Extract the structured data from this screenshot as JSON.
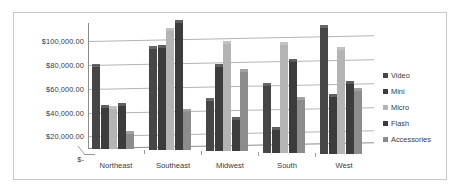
{
  "chart_data": {
    "type": "bar",
    "title": "",
    "subtitle": "",
    "xlabel": "",
    "ylabel": "",
    "grid": true,
    "legend_position": "right",
    "categories": [
      "Northeast",
      "Southeast",
      "Midwest",
      "South",
      "West"
    ],
    "ylim": [
      0,
      100000
    ],
    "ytick_values": [
      100000,
      80000,
      60000,
      40000,
      20000,
      0
    ],
    "ytick_labels": [
      "$100,000.00",
      "$80,000.00",
      "$60,000.00",
      "$40,000.00",
      "$20,000.00",
      "$-"
    ],
    "series": [
      {
        "name": "Video",
        "color": "#464646",
        "values": [
          65000,
          80000,
          40000,
          53000,
          100000
        ]
      },
      {
        "name": "Mini",
        "color": "#3c3c3c",
        "values": [
          33000,
          81000,
          67000,
          18000,
          45000
        ]
      },
      {
        "name": "Micro",
        "color": "#b4b4b4",
        "values": [
          32000,
          95000,
          85000,
          85000,
          82000
        ]
      },
      {
        "name": "Flash",
        "color": "#3c3c3c",
        "values": [
          34000,
          101000,
          25000,
          72000,
          55000
        ]
      },
      {
        "name": "Accessories",
        "color": "#8c8c8c",
        "values": [
          12000,
          30000,
          63000,
          42000,
          50000
        ]
      }
    ]
  },
  "legend": {
    "items": [
      {
        "label": "Video",
        "color": "#464646"
      },
      {
        "label": "Mini",
        "color": "#3c3c3c"
      },
      {
        "label": "Micro",
        "color": "#b4b4b4"
      },
      {
        "label": "Flash",
        "color": "#3c3c3c"
      },
      {
        "label": "Accessories",
        "color": "#8c8c8c"
      }
    ]
  },
  "colors": {
    "plot_background": "#ffffff",
    "frame_border": "#c9c9c9",
    "gridline": "#b4b4b4",
    "axis_line": "#8c8c8c",
    "text": "#3a3a3a"
  }
}
